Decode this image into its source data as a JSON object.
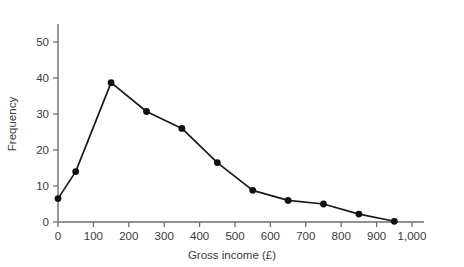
{
  "chart_data": {
    "type": "line",
    "title": "",
    "xlabel": "Gross income (£)",
    "ylabel": "Frequency",
    "xlim": [
      0,
      1000
    ],
    "ylim": [
      0,
      55
    ],
    "grid": false,
    "legend": "none",
    "x": [
      0,
      50,
      150,
      250,
      350,
      450,
      550,
      650,
      750,
      850,
      950
    ],
    "values": [
      6.5,
      14,
      38.7,
      30.7,
      26,
      16.5,
      8.8,
      6,
      5,
      2.2,
      0.2
    ],
    "x_tick_labels": [
      "0",
      "100",
      "200",
      "300",
      "400",
      "500",
      "600",
      "700",
      "800",
      "900",
      "1,000"
    ],
    "x_tick_values": [
      0,
      100,
      200,
      300,
      400,
      500,
      600,
      700,
      800,
      900,
      1000
    ],
    "y_tick_labels": [
      "0",
      "10",
      "20",
      "30",
      "40",
      "50"
    ],
    "y_tick_values": [
      0,
      10,
      20,
      30,
      40,
      50
    ],
    "marker": "filled-circle",
    "line_color": "#101010",
    "marker_color": "#101010",
    "axis_color": "#6e6e6e",
    "text_color": "#3a3a3a",
    "background_color": "#ffffff"
  }
}
